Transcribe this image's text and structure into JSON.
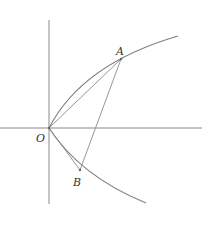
{
  "diagram": {
    "labels": {
      "A": "A",
      "B": "B",
      "O": "O"
    },
    "colors": {
      "stroke": "#8a8a8a",
      "curve": "#7f7f7f",
      "text": "#333333"
    },
    "origin": {
      "x": 49,
      "y": 128
    },
    "curve": "parabola y^2 = 2px opening right",
    "segments": [
      "OA",
      "OB",
      "AB"
    ]
  }
}
